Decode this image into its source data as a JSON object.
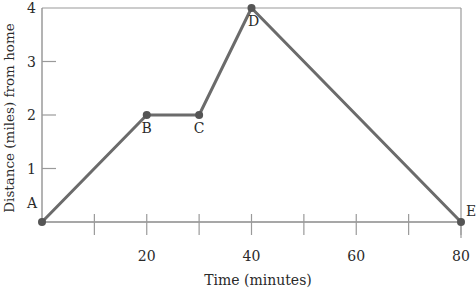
{
  "chart_data": {
    "type": "line",
    "title": "",
    "xlabel": "Time (minutes)",
    "ylabel": "Distance (miles) from home",
    "xlim": [
      0,
      80
    ],
    "ylim": [
      0,
      4
    ],
    "x_ticks": [
      10,
      20,
      30,
      40,
      50,
      60,
      70,
      80
    ],
    "x_tick_labels": [
      "20",
      "40",
      "60",
      "80"
    ],
    "x_tick_label_values": [
      20,
      40,
      60,
      80
    ],
    "y_ticks": [
      1,
      2,
      3,
      4
    ],
    "y_tick_labels": [
      "1",
      "2",
      "3",
      "4"
    ],
    "grid": false,
    "legend": null,
    "series": [
      {
        "name": "Distance from home",
        "points": [
          {
            "label": "A",
            "x": 0,
            "y": 0
          },
          {
            "label": "B",
            "x": 20,
            "y": 2
          },
          {
            "label": "C",
            "x": 30,
            "y": 2
          },
          {
            "label": "D",
            "x": 40,
            "y": 4
          },
          {
            "label": "E",
            "x": 80,
            "y": 0
          }
        ]
      }
    ]
  },
  "style": {
    "line_color": "#6b6b6b",
    "marker_color": "#555555",
    "axis_color": "#8a8a8a",
    "frame_color": "#9a9a9a"
  }
}
